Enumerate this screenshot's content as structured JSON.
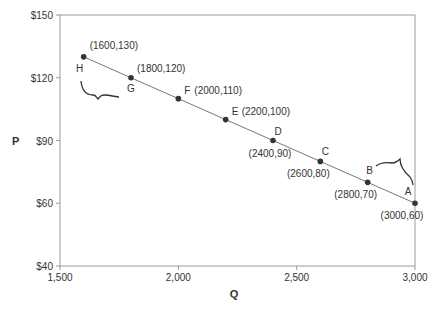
{
  "chart_data": {
    "type": "line",
    "title": "",
    "xlabel": "Q",
    "ylabel": "P",
    "xlim": [
      1500,
      3000
    ],
    "y_tick_labels": [
      "$150",
      "$120",
      "$90",
      "$60",
      "$40"
    ],
    "x_tick_labels": [
      "1,500",
      "2,000",
      "2,500",
      "3,000"
    ],
    "grid": false,
    "series": [
      {
        "name": "Demand",
        "points": [
          {
            "label": "H",
            "x": 1600,
            "y": 130,
            "annotation": "(1600,130)"
          },
          {
            "label": "G",
            "x": 1800,
            "y": 120,
            "annotation": "(1800,120)"
          },
          {
            "label": "F",
            "x": 2000,
            "y": 110,
            "annotation": "(2000,110)"
          },
          {
            "label": "E",
            "x": 2200,
            "y": 100,
            "annotation": "(2200,100)"
          },
          {
            "label": "D",
            "x": 2400,
            "y": 90,
            "annotation": "(2400,90)"
          },
          {
            "label": "C",
            "x": 2600,
            "y": 80,
            "annotation": "(2600,80)"
          },
          {
            "label": "B",
            "x": 2800,
            "y": 70,
            "annotation": "(2800,70)"
          },
          {
            "label": "A",
            "x": 3000,
            "y": 60,
            "annotation": "(3000,60)"
          }
        ]
      }
    ],
    "annotations": [
      "brace between H and G",
      "brace between B and A"
    ]
  }
}
